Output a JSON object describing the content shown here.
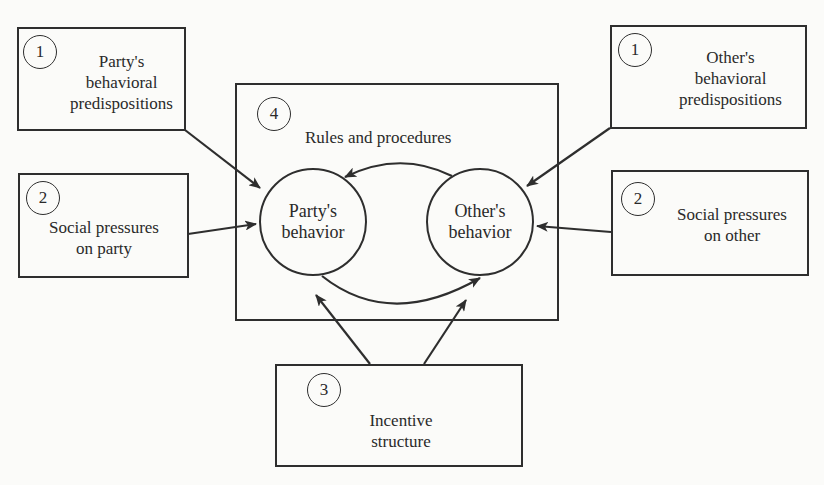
{
  "diagram": {
    "nodes": {
      "party_predispositions": {
        "number": "1",
        "label": "Party's\nbehavioral\npredispositions"
      },
      "party_social_pressures": {
        "number": "2",
        "label": "Social pressures\non party"
      },
      "other_predispositions": {
        "number": "1",
        "label": "Other's\nbehavioral\npredispositions"
      },
      "other_social_pressures": {
        "number": "2",
        "label": "Social pressures\non other"
      },
      "incentive_structure": {
        "number": "3",
        "label": "Incentive\nstructure"
      },
      "rules_procedures": {
        "number": "4",
        "label": "Rules and procedures"
      },
      "party_behavior": {
        "label": "Party's\nbehavior"
      },
      "other_behavior": {
        "label": "Other's\nbehavior"
      }
    },
    "edges": [
      {
        "from": "party_predispositions",
        "to": "party_behavior"
      },
      {
        "from": "party_social_pressures",
        "to": "party_behavior"
      },
      {
        "from": "other_predispositions",
        "to": "other_behavior"
      },
      {
        "from": "other_social_pressures",
        "to": "other_behavior"
      },
      {
        "from": "incentive_structure",
        "to": "party_behavior"
      },
      {
        "from": "incentive_structure",
        "to": "other_behavior"
      },
      {
        "from": "other_behavior",
        "to": "party_behavior",
        "style": "curved-top"
      },
      {
        "from": "party_behavior",
        "to": "other_behavior",
        "style": "curved-bottom"
      }
    ],
    "colors": {
      "line": "#2e2e2e",
      "background": "#fbfbf9"
    }
  }
}
